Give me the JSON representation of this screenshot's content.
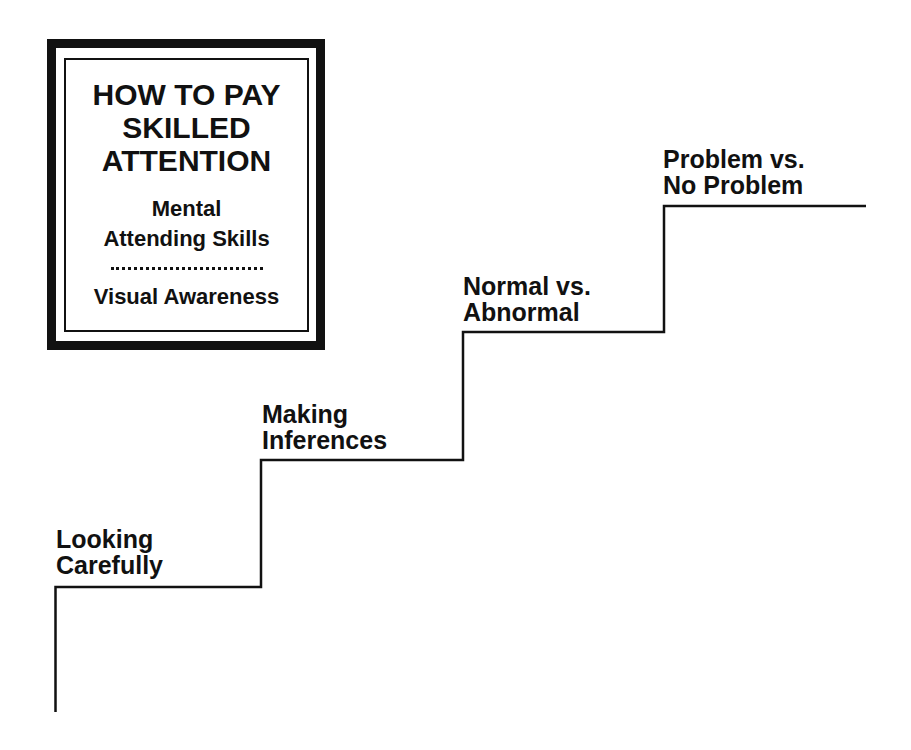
{
  "title_box": {
    "heading_lines": [
      "HOW TO PAY",
      "SKILLED",
      "ATTENTION"
    ],
    "subheading_lines": [
      "Mental",
      "Attending Skills"
    ],
    "divider": "dotted",
    "footer": "Visual Awareness"
  },
  "staircase": {
    "direction": "ascending left-to-right",
    "line_color": "#111111",
    "steps": [
      {
        "level": 1,
        "label_lines": [
          "Looking",
          "Carefully"
        ]
      },
      {
        "level": 2,
        "label_lines": [
          "Making",
          "Inferences"
        ]
      },
      {
        "level": 3,
        "label_lines": [
          "Normal vs.",
          "Abnormal"
        ]
      },
      {
        "level": 4,
        "label_lines": [
          "Problem vs.",
          "No Problem"
        ]
      }
    ]
  },
  "colors": {
    "background": "#ffffff",
    "ink": "#111111"
  }
}
